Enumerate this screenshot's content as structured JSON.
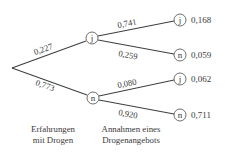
{
  "diagram": {
    "type": "probability-tree",
    "partial_label_top_left": "",
    "root": {
      "x": 12,
      "y": 68
    },
    "level1": [
      {
        "id": "j",
        "label": "j",
        "x": 92,
        "y": 38,
        "branch_prob": "0,227"
      },
      {
        "id": "n",
        "label": "n",
        "x": 93,
        "y": 98,
        "branch_prob": "0,773"
      }
    ],
    "level2": [
      {
        "parent": "j",
        "label": "j",
        "x": 180,
        "y": 20,
        "branch_prob": "0,741",
        "path_prob": "0,168"
      },
      {
        "parent": "j",
        "label": "n",
        "x": 180,
        "y": 55,
        "branch_prob": "0,259",
        "path_prob": "0,059"
      },
      {
        "parent": "n",
        "label": "j",
        "x": 180,
        "y": 79,
        "branch_prob": "0,080",
        "path_prob": "0,062"
      },
      {
        "parent": "n",
        "label": "n",
        "x": 180,
        "y": 115,
        "branch_prob": "0,920",
        "path_prob": "0,711"
      }
    ],
    "stage_labels": {
      "stage1": {
        "line1": "Erfahrungen",
        "line2": "mit Drogen"
      },
      "stage2": {
        "line1": "Annahmen eines",
        "line2": "Drogenangebots"
      }
    }
  }
}
